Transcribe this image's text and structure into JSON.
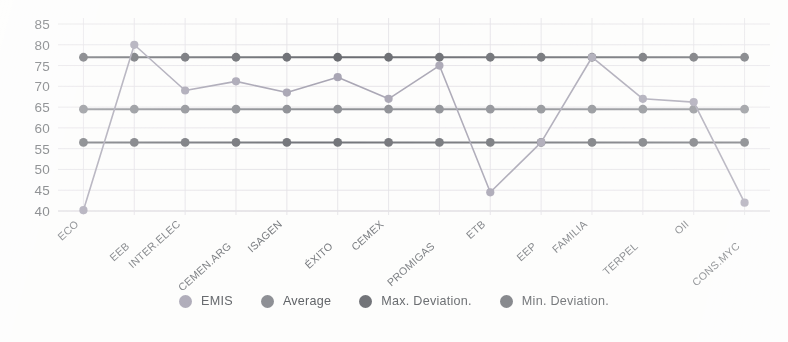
{
  "chart_data": {
    "type": "line",
    "title": "",
    "subtitle": "",
    "xlabel": "",
    "ylabel": "",
    "grid": true,
    "legend_position": "bottom",
    "ylim": [
      40,
      85
    ],
    "ytick_step": 5,
    "ytick_labels": [
      "85",
      "80",
      "75",
      "70",
      "65",
      "60",
      "55",
      "50",
      "45",
      "40"
    ],
    "categories": [
      "ECO",
      "EEB",
      "INTER.ELEC",
      "CEMEN.ARG",
      "ISAGEN",
      "ÉXITO",
      "CEMEX",
      "PROMIGAS",
      "ETB",
      "EEP",
      "FAMILIA",
      "TERPEL",
      "OII",
      "CONS.MYC"
    ],
    "series": [
      {
        "name": "EMIS",
        "color": "#a9a6b4",
        "values": [
          40.2,
          80.0,
          69.0,
          71.2,
          68.5,
          72.2,
          67.0,
          75.0,
          44.5,
          56.5,
          77.0,
          67.0,
          66.2,
          42.0
        ]
      },
      {
        "name": "Average",
        "color": "#8e9095",
        "values": [
          64.5,
          64.5,
          64.5,
          64.5,
          64.5,
          64.5,
          64.5,
          64.5,
          64.5,
          64.5,
          64.5,
          64.5,
          64.5,
          64.5
        ]
      },
      {
        "name": "Max. Deviation.",
        "color": "#6b6d72",
        "values": [
          77.0,
          77.0,
          77.0,
          77.0,
          77.0,
          77.0,
          77.0,
          77.0,
          77.0,
          77.0,
          77.0,
          77.0,
          77.0,
          77.0
        ]
      },
      {
        "name": "Min. Deviation.",
        "color": "#73757a",
        "values": [
          56.5,
          56.5,
          56.5,
          56.5,
          56.5,
          56.5,
          56.5,
          56.5,
          56.5,
          56.5,
          56.5,
          56.5,
          56.5,
          56.5
        ]
      }
    ]
  },
  "legend": {
    "items": [
      {
        "label": "EMIS",
        "color": "#aaa7b5"
      },
      {
        "label": "Average",
        "color": "#8e9095"
      },
      {
        "label": "Max. Deviation.",
        "color": "#6b6d72"
      },
      {
        "label": "Min. Deviation.",
        "color": "#76787d"
      }
    ]
  },
  "colors": {
    "background": "#fdfdfc",
    "grid": "#e4e2e6",
    "axis_text": "#6a6d71",
    "category_text": "#75787c"
  }
}
